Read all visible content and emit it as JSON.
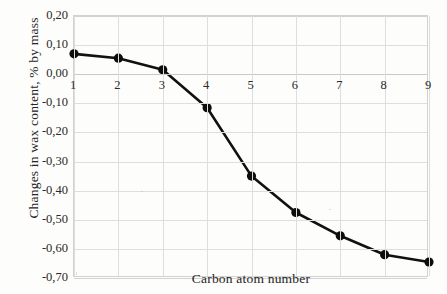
{
  "chart_data": {
    "type": "line",
    "title": "",
    "xlabel": "Carbon atom number",
    "ylabel": "Changes in wax content, % by mass",
    "x": [
      1,
      2,
      3,
      4,
      5,
      6,
      7,
      8,
      9
    ],
    "categories": [
      "1",
      "2",
      "3",
      "4",
      "5",
      "6",
      "7",
      "8",
      "9"
    ],
    "values": [
      0.07,
      0.055,
      0.015,
      -0.115,
      -0.35,
      -0.475,
      -0.555,
      -0.62,
      -0.645
    ],
    "series": [
      {
        "name": "Changes in wax content",
        "values": [
          0.07,
          0.055,
          0.015,
          -0.115,
          -0.35,
          -0.475,
          -0.555,
          -0.62,
          -0.645
        ]
      }
    ],
    "xlim": [
      1,
      9
    ],
    "ylim": [
      -0.7,
      0.2
    ],
    "ytick_values": [
      0.2,
      0.1,
      0.0,
      -0.1,
      -0.2,
      -0.3,
      -0.4,
      -0.5,
      -0.6,
      -0.7
    ],
    "ytick_labels": [
      "0,20",
      "0,10",
      "0,00",
      "-0,10",
      "-0,20",
      "-0,30",
      "-0,40",
      "-0,50",
      "-0,60",
      "-0,70"
    ],
    "xtick_labels": [
      "1",
      "2",
      "3",
      "4",
      "5",
      "6",
      "7",
      "8",
      "9"
    ],
    "grid": true,
    "legend": false,
    "legend_position": "none",
    "decimal_separator": ",",
    "line_color": "#111111",
    "marker_color": "#0d0d0d",
    "grid_color": "#dedede",
    "background_color": "#fdfdfb"
  }
}
